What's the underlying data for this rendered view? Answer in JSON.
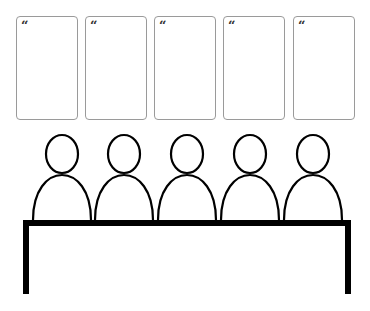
{
  "cards": [
    {
      "quote_mark": "“",
      "x": 16
    },
    {
      "quote_mark": "“",
      "x": 85
    },
    {
      "quote_mark": "“",
      "x": 154
    },
    {
      "quote_mark": "“",
      "x": 223
    },
    {
      "quote_mark": "“",
      "x": 293
    }
  ],
  "people_count": 5,
  "colors": {
    "stroke": "#000000",
    "card_border": "#9a9a9a",
    "quote": "#333333"
  }
}
